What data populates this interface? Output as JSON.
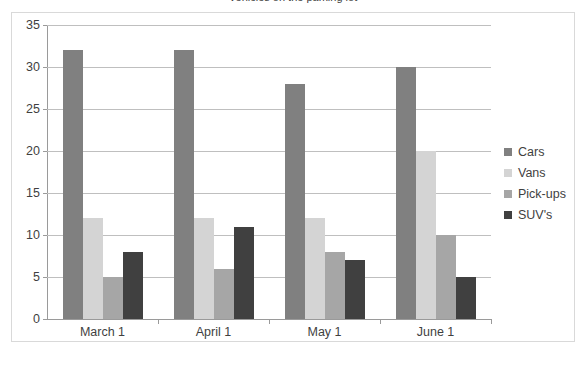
{
  "title_partial": "Vehicles on the parking lot",
  "chart_data": {
    "type": "bar",
    "title": "Vehicles on the parking lot",
    "xlabel": "",
    "ylabel": "",
    "categories": [
      "March 1",
      "April 1",
      "May 1",
      "June 1"
    ],
    "series": [
      {
        "name": "Cars",
        "color": "#808080",
        "values": [
          32,
          32,
          28,
          30
        ]
      },
      {
        "name": "Vans",
        "color": "#d4d4d4",
        "values": [
          12,
          12,
          12,
          20
        ]
      },
      {
        "name": "Pick-ups",
        "color": "#a6a6a6",
        "values": [
          5,
          6,
          8,
          10
        ]
      },
      {
        "name": "SUV's",
        "color": "#404040",
        "values": [
          8,
          11,
          7,
          5
        ]
      }
    ],
    "ylim": [
      0,
      35
    ],
    "yticks": [
      0,
      5,
      10,
      15,
      20,
      25,
      30,
      35
    ],
    "ytick_labels": [
      "0",
      "5",
      "10",
      "15",
      "20",
      "25",
      "30",
      "35"
    ],
    "grid": true,
    "grid_axis": "y",
    "legend_position": "right",
    "legend_entries": [
      "Cars",
      "Vans",
      "Pick-ups",
      "SUV's"
    ]
  },
  "colors": {
    "frame_border": "#d9d9d9",
    "gridline": "#bfbfbf",
    "axis_line": "#9a9a9a",
    "text": "#3f3f3f",
    "background": "#ffffff"
  }
}
